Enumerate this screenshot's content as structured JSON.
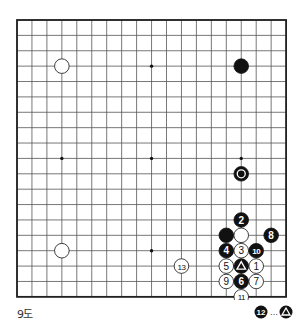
{
  "diagram": {
    "title": "9도",
    "board_size": 19,
    "geometry": {
      "left": 17,
      "top": 20,
      "dx": 14.95,
      "dy": 15.38,
      "stone_r": 7.3
    },
    "colors": {
      "line": "#555555",
      "border": "#222222",
      "black": "#111111",
      "white": "#ffffff",
      "star": "#111111"
    },
    "star_points": [
      [
        3,
        3
      ],
      [
        9,
        3
      ],
      [
        15,
        3
      ],
      [
        3,
        9
      ],
      [
        9,
        9
      ],
      [
        15,
        9
      ],
      [
        3,
        15
      ],
      [
        9,
        15
      ],
      [
        15,
        15
      ]
    ],
    "stones": [
      {
        "color": "white",
        "col": 3,
        "row": 3,
        "label": ""
      },
      {
        "color": "black",
        "col": 15,
        "row": 3,
        "label": ""
      },
      {
        "color": "black",
        "col": 15,
        "row": 10,
        "label": "",
        "mark": "circle"
      },
      {
        "color": "white",
        "col": 3,
        "row": 15,
        "label": ""
      },
      {
        "color": "black",
        "col": 15,
        "row": 13,
        "label": "2"
      },
      {
        "color": "black",
        "col": 14,
        "row": 14,
        "label": ""
      },
      {
        "color": "white",
        "col": 15,
        "row": 14,
        "label": ""
      },
      {
        "color": "black",
        "col": 17,
        "row": 14,
        "label": "8"
      },
      {
        "color": "black",
        "col": 14,
        "row": 15,
        "label": "4"
      },
      {
        "color": "white",
        "col": 15,
        "row": 15,
        "label": "3"
      },
      {
        "color": "black",
        "col": 16,
        "row": 15,
        "label": "10"
      },
      {
        "color": "white",
        "col": 11,
        "row": 16,
        "label": "13"
      },
      {
        "color": "white",
        "col": 14,
        "row": 16,
        "label": "5"
      },
      {
        "color": "black",
        "col": 15,
        "row": 16,
        "label": "",
        "mark": "triangle"
      },
      {
        "color": "white",
        "col": 16,
        "row": 16,
        "label": "1"
      },
      {
        "color": "white",
        "col": 14,
        "row": 17,
        "label": "9"
      },
      {
        "color": "black",
        "col": 15,
        "row": 17,
        "label": "6"
      },
      {
        "color": "white",
        "col": 16,
        "row": 17,
        "label": "7"
      },
      {
        "color": "white",
        "col": 15,
        "row": 18,
        "label": "11"
      }
    ],
    "footnote": {
      "move_label": "12",
      "separator": "…",
      "target_mark": "triangle",
      "text": "12 … ▲"
    }
  }
}
